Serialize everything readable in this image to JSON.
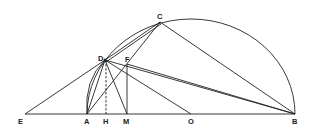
{
  "diagram": {
    "type": "geometry-construction",
    "points": {
      "A": {
        "label": "A",
        "x": 87,
        "y": 114
      },
      "B": {
        "label": "B",
        "x": 295,
        "y": 114
      },
      "C": {
        "label": "C",
        "x": 160,
        "y": 22
      },
      "D": {
        "label": "D",
        "x": 105,
        "y": 60
      },
      "E": {
        "label": "E",
        "x": 25,
        "y": 115
      },
      "F": {
        "label": "F",
        "x": 127,
        "y": 63
      },
      "H": {
        "label": "H",
        "x": 106,
        "y": 114
      },
      "M": {
        "label": "M",
        "x": 127,
        "y": 114
      },
      "O": {
        "label": "O",
        "x": 191,
        "y": 114
      }
    },
    "labels": [
      "A",
      "B",
      "C",
      "D",
      "E",
      "F",
      "H",
      "M",
      "O"
    ],
    "segments": [
      "E-B",
      "E-D",
      "E-C",
      "A-D",
      "A-C",
      "D-C",
      "D-B",
      "D-M",
      "D-O",
      "C-B",
      "F-M",
      "F-B",
      "A-F"
    ],
    "dashed_segments": [
      "D-H"
    ],
    "arcs": [
      "semicircle A-B through C",
      "arc A-D"
    ]
  }
}
